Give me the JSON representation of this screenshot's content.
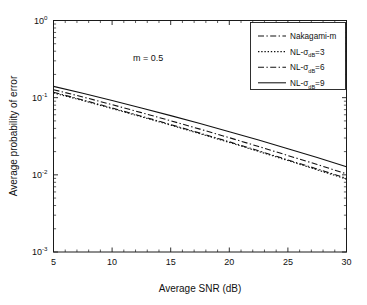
{
  "figure": {
    "background": "#ffffff",
    "foreground": "#111111"
  },
  "chart_data": {
    "type": "line",
    "title": "",
    "xlabel": "Average SNR (dB)",
    "ylabel": "Average probability of error",
    "xscale": "linear",
    "yscale": "log",
    "xlim": [
      5,
      30
    ],
    "ylim": [
      0.001,
      1
    ],
    "grid": false,
    "legend_position": "upper right",
    "annotations": [
      {
        "text": "m = 0.5",
        "x": 12.5,
        "y": 0.42
      }
    ],
    "xticks": [
      5,
      10,
      15,
      20,
      25,
      30
    ],
    "xtick_labels": [
      "5",
      "10",
      "15",
      "20",
      "25",
      "30"
    ],
    "yticks": [
      1,
      0.1,
      0.01,
      0.001
    ],
    "ytick_labels": [
      "10^0",
      "10^-1",
      "10^-2",
      "10^-3"
    ],
    "ytick_mantissa": [
      "10",
      "10",
      "10",
      "10"
    ],
    "ytick_exponent": [
      "0",
      "-1",
      "-2",
      "-3"
    ],
    "x": [
      5,
      7.5,
      10,
      12.5,
      15,
      17.5,
      20,
      22.5,
      25,
      27.5,
      30
    ],
    "series": [
      {
        "name": "Nakagami-m",
        "label": "Nakagami-m",
        "style": "dashdot",
        "color": "#111111",
        "values": [
          0.1175,
          0.0935,
          0.0735,
          0.0575,
          0.0448,
          0.0347,
          0.0268,
          0.0205,
          0.0156,
          0.0119,
          0.009
        ]
      },
      {
        "name": "NL-sigma-dB-3",
        "label_prefix": "NL-",
        "label_sigma": "σ",
        "label_sub": "dB",
        "label_suffix": "=3",
        "style": "dotted",
        "color": "#111111",
        "values": [
          0.115,
          0.0918,
          0.0722,
          0.0565,
          0.044,
          0.0341,
          0.0263,
          0.0201,
          0.0153,
          0.0116,
          0.0088
        ]
      },
      {
        "name": "NL-sigma-dB-6",
        "label_prefix": "NL-",
        "label_sigma": "σ",
        "label_sub": "dB",
        "label_suffix": "=6",
        "style": "dashdot",
        "color": "#111111",
        "values": [
          0.127,
          0.1022,
          0.0812,
          0.064,
          0.0502,
          0.0391,
          0.0303,
          0.0233,
          0.0178,
          0.0136,
          0.0103
        ]
      },
      {
        "name": "NL-sigma-dB-9",
        "label_prefix": "NL-",
        "label_sigma": "σ",
        "label_sub": "dB",
        "label_suffix": "=9",
        "style": "solid",
        "color": "#111111",
        "values": [
          0.14,
          0.114,
          0.092,
          0.0735,
          0.0585,
          0.0462,
          0.0362,
          0.0282,
          0.0218,
          0.0168,
          0.0127
        ]
      }
    ]
  },
  "legend": {
    "entries": [
      {
        "label": "Nakagami-m"
      },
      {
        "label": "NL-σdB=3"
      },
      {
        "label": "NL-σdB=6"
      },
      {
        "label": "NL-σdB=9"
      }
    ]
  }
}
